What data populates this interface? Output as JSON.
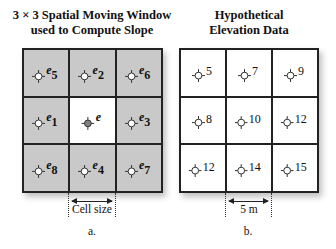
{
  "panel_a": {
    "title_line1": "3 × 3 Spatial Moving Window",
    "title_line2": "used to Compute Slope",
    "cells": [
      {
        "name": "e",
        "sub": "5",
        "fill": "grey"
      },
      {
        "name": "e",
        "sub": "2",
        "fill": "grey"
      },
      {
        "name": "e",
        "sub": "6",
        "fill": "grey"
      },
      {
        "name": "e",
        "sub": "1",
        "fill": "grey"
      },
      {
        "name": "e",
        "sub": "",
        "fill": "white",
        "center": true
      },
      {
        "name": "e",
        "sub": "3",
        "fill": "grey"
      },
      {
        "name": "e",
        "sub": "8",
        "fill": "grey"
      },
      {
        "name": "e",
        "sub": "4",
        "fill": "grey"
      },
      {
        "name": "e",
        "sub": "7",
        "fill": "grey"
      }
    ],
    "dimension_label": "Cell size",
    "caption": "a."
  },
  "panel_b": {
    "title_line1": "Hypothetical",
    "title_line2": "Elevation Data",
    "values": [
      "5",
      "7",
      "9",
      "8",
      "10",
      "12",
      "12",
      "14",
      "15"
    ],
    "dimension_label": "5 m",
    "caption": "b."
  },
  "colors": {
    "grey_cell": "#c9c9c9",
    "center_point": "#808080",
    "line": "#222222"
  }
}
